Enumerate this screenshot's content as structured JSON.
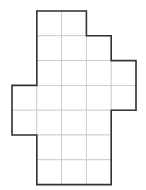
{
  "diagram": {
    "type": "grid-polyomino",
    "cell_size": 24.8,
    "origin": {
      "x": 12,
      "y": 11
    },
    "rows": [
      {
        "row": 0,
        "cols": [
          1,
          2
        ]
      },
      {
        "row": 1,
        "cols": [
          1,
          2,
          3
        ]
      },
      {
        "row": 2,
        "cols": [
          1,
          2,
          3,
          4
        ]
      },
      {
        "row": 3,
        "cols": [
          0,
          1,
          2,
          3,
          4
        ]
      },
      {
        "row": 4,
        "cols": [
          0,
          1,
          2,
          3
        ]
      },
      {
        "row": 5,
        "cols": [
          1,
          2,
          3
        ]
      },
      {
        "row": 6,
        "cols": [
          1,
          2,
          3
        ]
      }
    ],
    "total_cells": 24,
    "colors": {
      "outline": "#333333",
      "grid": "#c8c8c8",
      "fill": "#ffffff"
    }
  }
}
